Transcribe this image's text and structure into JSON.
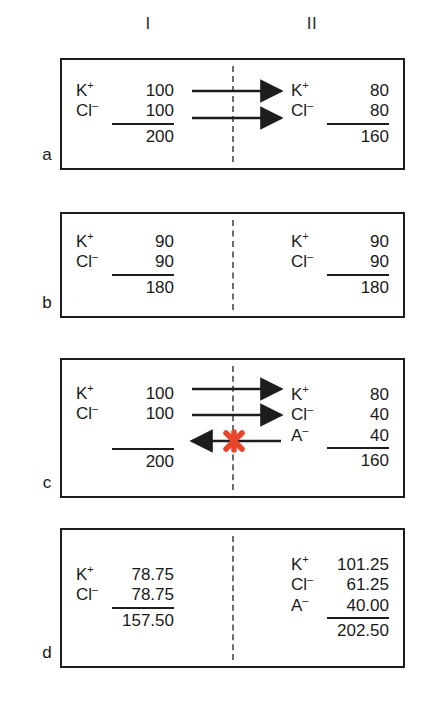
{
  "figure": {
    "type": "gibbs-donnan-equilibrium-diagram",
    "column_headers": [
      "I",
      "II"
    ],
    "membrane_style": "dashed vertical line",
    "block_marker_color": "#e8442a",
    "panels": [
      {
        "label": "a",
        "left": {
          "rows": [
            {
              "ion": "K",
              "charge": "+",
              "value": "100"
            },
            {
              "ion": "Cl",
              "charge": "–",
              "value": "100",
              "underlined": true
            }
          ],
          "total": "200"
        },
        "right": {
          "rows": [
            {
              "ion": "K",
              "charge": "+",
              "value": "80"
            },
            {
              "ion": "Cl",
              "charge": "–",
              "value": "80",
              "underlined": true
            }
          ],
          "total": "160"
        },
        "arrows": [
          {
            "direction": "right",
            "row": 1,
            "blocked": false
          },
          {
            "direction": "right",
            "row": 2,
            "blocked": false
          }
        ]
      },
      {
        "label": "b",
        "left": {
          "rows": [
            {
              "ion": "K",
              "charge": "+",
              "value": "90"
            },
            {
              "ion": "Cl",
              "charge": "–",
              "value": "90",
              "underlined": true
            }
          ],
          "total": "180"
        },
        "right": {
          "rows": [
            {
              "ion": "K",
              "charge": "+",
              "value": "90"
            },
            {
              "ion": "Cl",
              "charge": "–",
              "value": "90",
              "underlined": true
            }
          ],
          "total": "180"
        },
        "arrows": []
      },
      {
        "label": "c",
        "left": {
          "rows": [
            {
              "ion": "K",
              "charge": "+",
              "value": "100"
            },
            {
              "ion": "Cl",
              "charge": "–",
              "value": "100"
            },
            {
              "ion": "",
              "charge": "",
              "value": "",
              "blank": true,
              "underlined": true
            }
          ],
          "total": "200"
        },
        "right": {
          "rows": [
            {
              "ion": "K",
              "charge": "+",
              "value": "80"
            },
            {
              "ion": "Cl",
              "charge": "–",
              "value": "40"
            },
            {
              "ion": "A",
              "charge": "–",
              "value": "40",
              "underlined": true
            }
          ],
          "total": "160"
        },
        "arrows": [
          {
            "direction": "right",
            "row": 1,
            "blocked": false
          },
          {
            "direction": "right",
            "row": 2,
            "blocked": false
          },
          {
            "direction": "left",
            "row": 3,
            "blocked": true
          }
        ]
      },
      {
        "label": "d",
        "left": {
          "rows": [
            {
              "ion": "K",
              "charge": "+",
              "value": "78.75"
            },
            {
              "ion": "Cl",
              "charge": "–",
              "value": "78.75",
              "underlined": true
            }
          ],
          "total": "157.50"
        },
        "right": {
          "rows": [
            {
              "ion": "K",
              "charge": "+",
              "value": "101.25"
            },
            {
              "ion": "Cl",
              "charge": "–",
              "value": "61.25"
            },
            {
              "ion": "A",
              "charge": "–",
              "value": "40.00",
              "underlined": true
            }
          ],
          "total": "202.50"
        },
        "arrows": []
      }
    ]
  }
}
